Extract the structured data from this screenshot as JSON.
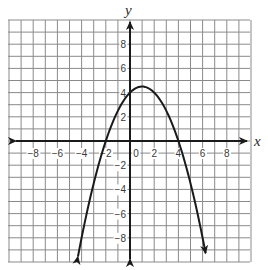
{
  "chart_data": {
    "type": "line",
    "title": "",
    "xlabel": "x",
    "ylabel": "y",
    "xlim": [
      -10,
      10
    ],
    "ylim": [
      -10,
      10
    ],
    "grid": true,
    "grid_step": 1,
    "x_ticks": [
      -8,
      -6,
      -4,
      -2,
      0,
      2,
      4,
      6,
      8
    ],
    "x_tick_labels": [
      "−8",
      "−6",
      "−4",
      "−2",
      "0",
      "2",
      "4",
      "6",
      "8"
    ],
    "y_ticks": [
      8,
      6,
      4,
      2,
      -2,
      -4,
      -6,
      -8
    ],
    "y_tick_labels": [
      "8",
      "6",
      "4",
      "2",
      "−2",
      "−4",
      "−6",
      "−8"
    ],
    "series": [
      {
        "name": "parabola",
        "equation": "y = -0.5x^2 + x + 4",
        "vertex": [
          1,
          4.5
        ],
        "x_intercepts": [
          -2,
          4
        ],
        "y_intercept": 4,
        "x_range": [
          -4.3,
          6.25
        ],
        "arrows_both_ends": true,
        "color": "#1a1a1a"
      }
    ],
    "axes_arrows": true
  },
  "style": {
    "grid_color": "#8a8a8a",
    "axis_color": "#1a1a1a",
    "curve_color": "#1a1a1a",
    "background": "#ffffff"
  }
}
